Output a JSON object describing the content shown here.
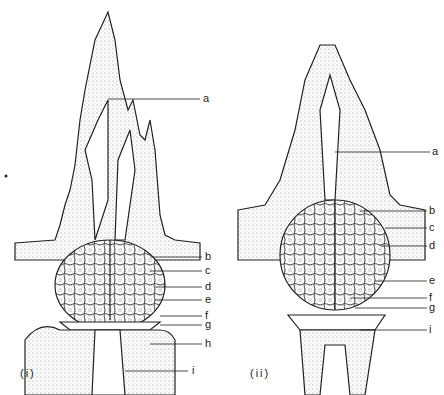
{
  "figure": {
    "panels": [
      {
        "caption": "(i)",
        "labels": [
          "a",
          "b",
          "c",
          "d",
          "e",
          "f",
          "g",
          "h",
          "i"
        ]
      },
      {
        "caption": "(ii)",
        "labels": [
          "a",
          "b",
          "c",
          "d",
          "e",
          "f",
          "g",
          "i"
        ]
      }
    ]
  }
}
